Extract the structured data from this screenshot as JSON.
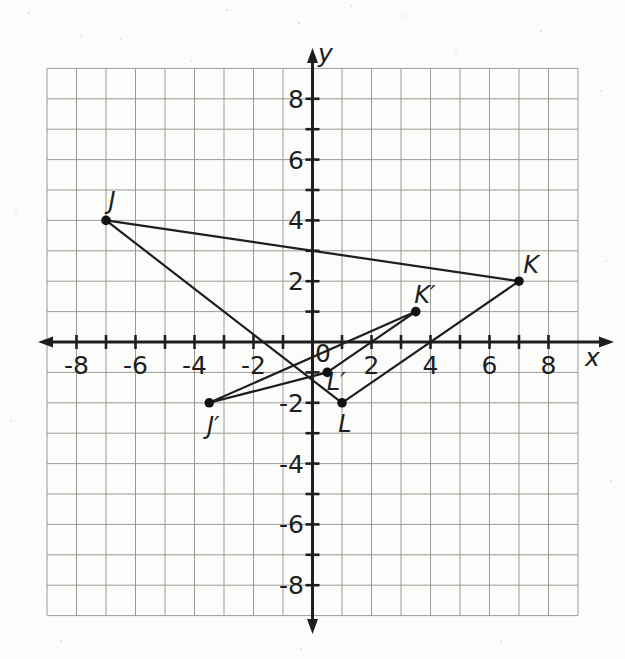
{
  "figure_title": "coordinate-plane-with-triangle-JKL-and-image-J'K'L'",
  "chart_data": {
    "type": "scatter",
    "title": "",
    "xlabel": "x",
    "ylabel": "y",
    "xlim": [
      -9,
      9
    ],
    "ylim": [
      -9,
      9
    ],
    "grid": true,
    "tick_interval": 1,
    "label_interval": 2,
    "origin_label": "0",
    "x_tick_labels": [
      {
        "value": -8,
        "text": "-8"
      },
      {
        "value": -6,
        "text": "-6"
      },
      {
        "value": -4,
        "text": "-4"
      },
      {
        "value": -2,
        "text": "-2"
      },
      {
        "value": 2,
        "text": "2"
      },
      {
        "value": 4,
        "text": "4"
      },
      {
        "value": 6,
        "text": "6"
      },
      {
        "value": 8,
        "text": "8"
      }
    ],
    "y_tick_labels": [
      {
        "value": 8,
        "text": "8"
      },
      {
        "value": 6,
        "text": "6"
      },
      {
        "value": 4,
        "text": "4"
      },
      {
        "value": 2,
        "text": "2"
      },
      {
        "value": -2,
        "text": "-2"
      },
      {
        "value": -4,
        "text": "-4"
      },
      {
        "value": -6,
        "text": "-6"
      },
      {
        "value": -8,
        "text": "-8"
      }
    ],
    "points": [
      {
        "id": "j",
        "label": "J",
        "x": -7,
        "y": 4,
        "label_dx": 6,
        "label_dy": -11
      },
      {
        "id": "k",
        "label": "K",
        "x": 7,
        "y": 2,
        "label_dx": 12,
        "label_dy": -8
      },
      {
        "id": "l",
        "label": "L",
        "x": 1,
        "y": -2,
        "label_dx": 3,
        "label_dy": 29
      },
      {
        "id": "j-prime",
        "label": "J′",
        "x": -3.5,
        "y": -2,
        "label_dx": 4,
        "label_dy": 31
      },
      {
        "id": "k-prime",
        "label": "K′",
        "x": 3.5,
        "y": 1,
        "label_dx": 9,
        "label_dy": -9
      },
      {
        "id": "l-prime",
        "label": "L′",
        "x": 0.5,
        "y": -1,
        "label_dx": 9,
        "label_dy": 18
      }
    ],
    "polygons": [
      {
        "name": "triangle-jkl",
        "vertices": [
          "j",
          "k",
          "l"
        ]
      },
      {
        "name": "triangle-j-k-l-prime",
        "vertices": [
          "j-prime",
          "k-prime",
          "l-prime"
        ]
      }
    ],
    "colors": {
      "paper": "#fcfcfa",
      "grid": "#9a9a96",
      "axis": "#1e1e1e",
      "figure": "#1e1e1e",
      "point": "#111111"
    }
  }
}
